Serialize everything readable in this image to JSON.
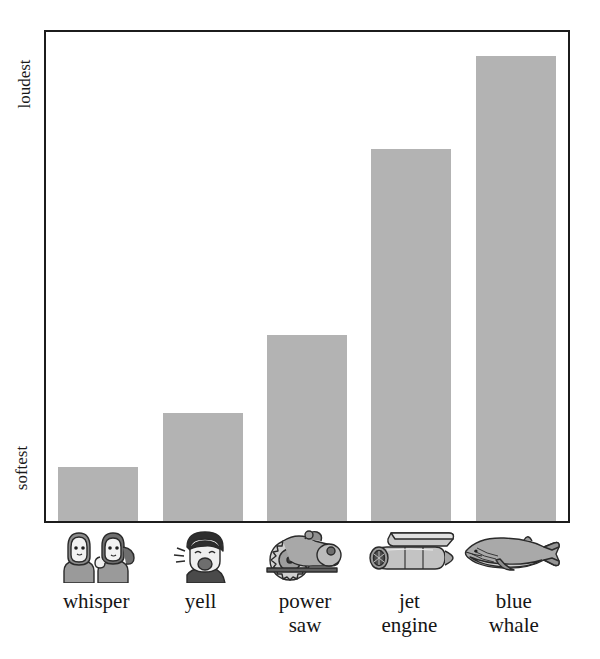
{
  "title": "to Loudest",
  "y_axis": {
    "top_label": "loudest",
    "bottom_label": "softest"
  },
  "colors": {
    "bar_fill": "#b3b3b3",
    "frame": "#1c1c1c",
    "text": "#1a1a1a",
    "background": "#ffffff"
  },
  "categories": [
    {
      "label_line1": "whisper",
      "label_line2": "",
      "icon": "two-people-whispering-icon"
    },
    {
      "label_line1": "yell",
      "label_line2": "",
      "icon": "shouting-person-icon"
    },
    {
      "label_line1": "power",
      "label_line2": "saw",
      "icon": "circular-saw-icon"
    },
    {
      "label_line1": "jet",
      "label_line2": "engine",
      "icon": "jet-engine-icon"
    },
    {
      "label_line1": "blue",
      "label_line2": "whale",
      "icon": "blue-whale-icon"
    }
  ],
  "chart_data": {
    "type": "bar",
    "title": "to Loudest",
    "xlabel": "",
    "ylabel": "",
    "grid": false,
    "legend": false,
    "categories": [
      "whisper",
      "yell",
      "power saw",
      "jet engine",
      "blue whale"
    ],
    "values": [
      11,
      22,
      38,
      76,
      95
    ],
    "ylim": [
      0,
      100
    ],
    "ytick_labels": [
      "softest",
      "loudest"
    ],
    "ytick_positions": [
      0,
      100
    ],
    "value_unit": "relative loudness (%)",
    "series": [
      {
        "name": "loudness",
        "values": [
          11,
          22,
          38,
          76,
          95
        ]
      }
    ]
  }
}
